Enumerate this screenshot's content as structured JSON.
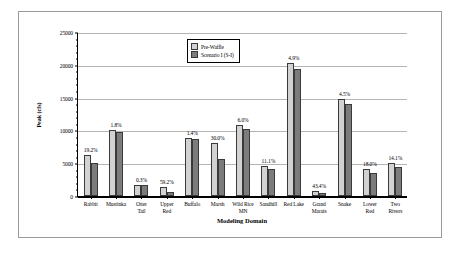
{
  "chart_data": {
    "type": "bar",
    "title": "",
    "xlabel": "Modeling Domain",
    "ylabel": "Peak (cfs)",
    "ylim": [
      0,
      25000
    ],
    "ytick_step": 5000,
    "yticks": [
      0,
      5000,
      10000,
      15000,
      20000,
      25000
    ],
    "ytick_labels": [
      "0",
      "5000",
      "10000",
      "15000",
      "20000",
      "25000"
    ],
    "grid": true,
    "legend_position": "top-center",
    "categories": [
      "Rabbit",
      "Mustinka",
      "Otter Tail",
      "Upper Red",
      "Buffalo",
      "Marsh",
      "Wild Rice MN",
      "Sandhill",
      "Red Lake",
      "Grand Marais",
      "Snake",
      "Lower Red",
      "Two Rivers"
    ],
    "category_lines": [
      [
        "Rabbit"
      ],
      [
        "Mustinka"
      ],
      [
        "Otter",
        "Tail"
      ],
      [
        "Upper",
        "Red"
      ],
      [
        "Buffalo"
      ],
      [
        "Marsh"
      ],
      [
        "Wild Rice",
        "MN"
      ],
      [
        "Sandhill"
      ],
      [
        "Red Lake"
      ],
      [
        "Grand",
        "Marais"
      ],
      [
        "Snake"
      ],
      [
        "Lower",
        "Red"
      ],
      [
        "Two",
        "Rivers"
      ]
    ],
    "series": [
      {
        "name": "Pre-Waffle",
        "color": "#d2d2d2",
        "values": [
          6200,
          10000,
          1700,
          1350,
          8800,
          8050,
          10800,
          4650,
          20300,
          750,
          14750,
          4050,
          5050
        ]
      },
      {
        "name": "Scenario I (S-I)",
        "color": "#7c7c7c",
        "values": [
          5000,
          9800,
          1700,
          650,
          8650,
          5650,
          10200,
          4150,
          19300,
          500,
          14050,
          3450,
          4400
        ]
      }
    ],
    "annotations": [
      "19.2%",
      "1.8%",
      "0.3%",
      "59.2%",
      "1.4%",
      "30.0%",
      "6.0%",
      "11.1%",
      "4.9%",
      "43.4%",
      "4.5%",
      "18.0%",
      "14.1%"
    ]
  }
}
